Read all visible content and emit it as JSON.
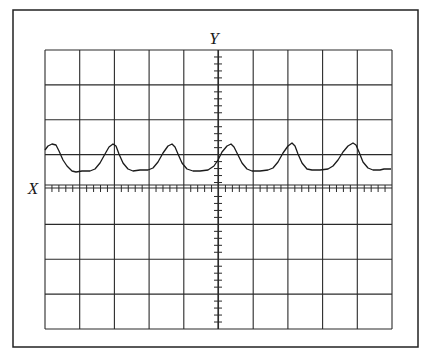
{
  "figure": {
    "y_axis_label": "Y",
    "x_axis_label": "X",
    "colors": {
      "ink": "#1a1a1a",
      "paper": "#ffffff"
    }
  },
  "frame": {
    "x": 13,
    "y": 10,
    "width": 405,
    "height": 337
  },
  "grid": {
    "x": 45,
    "y": 50,
    "width": 347,
    "height": 279,
    "columns": 10,
    "rows": 8,
    "center_x": 218,
    "x_axis_y": 188,
    "minor_ticks_per_division": 5
  },
  "waveform": {
    "description": "periodic pulse-like wave trace (six peaks)",
    "baseline_y": 171,
    "peak_y": 144,
    "points": [
      [
        45,
        150
      ],
      [
        48,
        146
      ],
      [
        52,
        144
      ],
      [
        56,
        145
      ],
      [
        59,
        151
      ],
      [
        63,
        160
      ],
      [
        67,
        166
      ],
      [
        72,
        171
      ],
      [
        76,
        172
      ],
      [
        82,
        171
      ],
      [
        90,
        171
      ],
      [
        95,
        169
      ],
      [
        100,
        163
      ],
      [
        105,
        154
      ],
      [
        109,
        147
      ],
      [
        113,
        144
      ],
      [
        116,
        146
      ],
      [
        119,
        154
      ],
      [
        123,
        163
      ],
      [
        128,
        169
      ],
      [
        133,
        171
      ],
      [
        140,
        170
      ],
      [
        148,
        170
      ],
      [
        153,
        168
      ],
      [
        158,
        162
      ],
      [
        163,
        153
      ],
      [
        168,
        146
      ],
      [
        172,
        144
      ],
      [
        175,
        147
      ],
      [
        178,
        154
      ],
      [
        182,
        163
      ],
      [
        187,
        169
      ],
      [
        193,
        171
      ],
      [
        200,
        171
      ],
      [
        208,
        170
      ],
      [
        214,
        166
      ],
      [
        218,
        160
      ],
      [
        222,
        152
      ],
      [
        227,
        146
      ],
      [
        231,
        144
      ],
      [
        234,
        147
      ],
      [
        238,
        155
      ],
      [
        242,
        163
      ],
      [
        247,
        169
      ],
      [
        252,
        171
      ],
      [
        260,
        171
      ],
      [
        268,
        170
      ],
      [
        273,
        168
      ],
      [
        278,
        162
      ],
      [
        283,
        153
      ],
      [
        288,
        146
      ],
      [
        292,
        143
      ],
      [
        295,
        146
      ],
      [
        298,
        154
      ],
      [
        302,
        163
      ],
      [
        307,
        169
      ],
      [
        312,
        170
      ],
      [
        320,
        170
      ],
      [
        328,
        169
      ],
      [
        333,
        166
      ],
      [
        338,
        160
      ],
      [
        343,
        152
      ],
      [
        348,
        146
      ],
      [
        353,
        143
      ],
      [
        356,
        145
      ],
      [
        359,
        152
      ],
      [
        363,
        162
      ],
      [
        368,
        168
      ],
      [
        373,
        170
      ],
      [
        380,
        170
      ],
      [
        384,
        169
      ],
      [
        391,
        169
      ]
    ]
  },
  "caption": {
    "text": "Figure caption text (partially cut off at bottom edge, illegible)"
  }
}
